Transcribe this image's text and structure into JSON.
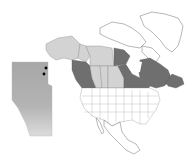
{
  "map": {
    "title": "",
    "description": "North America outline map with Canadian provinces/territories shaded and an inset of Alberta showing point locations",
    "colors": {
      "highlight_dark": "#6f6f6f",
      "highlight_light": "#d3d3d3",
      "outline_fill": "#ffffff",
      "inset_fill": "#a9a9a9",
      "marker": "#000000"
    },
    "regions": [
      {
        "name": "Alaska",
        "shade": "light"
      },
      {
        "name": "Yukon",
        "shade": "light"
      },
      {
        "name": "Northwest Territories",
        "shade": "light"
      },
      {
        "name": "Nunavut (mainland portion)",
        "shade": "dark"
      },
      {
        "name": "British Columbia",
        "shade": "dark"
      },
      {
        "name": "Alberta",
        "shade": "light"
      },
      {
        "name": "Saskatchewan",
        "shade": "light"
      },
      {
        "name": "Manitoba",
        "shade": "light"
      },
      {
        "name": "Ontario",
        "shade": "dark"
      },
      {
        "name": "Quebec",
        "shade": "dark"
      },
      {
        "name": "Atlantic Provinces",
        "shade": "dark"
      },
      {
        "name": "Greenland",
        "shade": "none"
      },
      {
        "name": "United States",
        "shade": "none"
      },
      {
        "name": "Mexico",
        "shade": "none"
      }
    ],
    "inset": {
      "region": "Alberta",
      "markers": [
        {
          "label": "site-1"
        },
        {
          "label": "site-2"
        }
      ]
    }
  }
}
